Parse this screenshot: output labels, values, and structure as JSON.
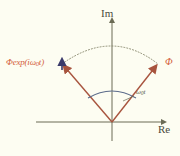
{
  "figure": {
    "background_color": "#fdfdf2"
  },
  "axes": {
    "imaginary_label": "Im",
    "real_label": "Re",
    "axis_color": "#6b6b55",
    "origin": {
      "x": 112,
      "y": 122
    },
    "im_axis": {
      "x": 112,
      "y_top": 18,
      "y_bottom": 140
    },
    "re_axis": {
      "y": 122,
      "x_left": 36,
      "x_right": 166
    }
  },
  "vectors": [
    {
      "name": "initial-phasor",
      "label": "Φ",
      "label_full": "Phi",
      "color": "#b5604a",
      "tip": {
        "x": 158,
        "y": 64
      },
      "angle_deg": 50,
      "label_pos": {
        "x": 166,
        "y": 58
      }
    },
    {
      "name": "rotated-phasor",
      "label": "Φexp(iω₀t)",
      "label_parts": {
        "prefix": "Φexp(iω",
        "sub": "0",
        "suffix": "t)"
      },
      "color": "#b5604a",
      "tip": {
        "x": 62,
        "y": 64
      },
      "angle_deg": 130,
      "label_pos": {
        "x": 6,
        "y": 58
      }
    }
  ],
  "angle_arc": {
    "label": "ω₀t",
    "label_parts": {
      "prefix": "ω",
      "sub": "0",
      "suffix": "t"
    },
    "color": "#5b6b8a",
    "label_pos": {
      "x": 136,
      "y": 93
    },
    "leader_from": {
      "x": 134,
      "y": 96
    },
    "leader_to": {
      "x": 124,
      "y": 100
    }
  },
  "trajectory_arc": {
    "name": "rotation-path",
    "style": "dotted",
    "color": "#8a8a70",
    "from": {
      "x": 62,
      "y": 64
    },
    "to": {
      "x": 158,
      "y": 64
    },
    "apex": {
      "x": 112,
      "y": 37
    }
  },
  "direction_marker": {
    "name": "rotation-direction-arrow",
    "color": "#3a3a6a",
    "at": {
      "x": 61,
      "y": 62
    }
  }
}
